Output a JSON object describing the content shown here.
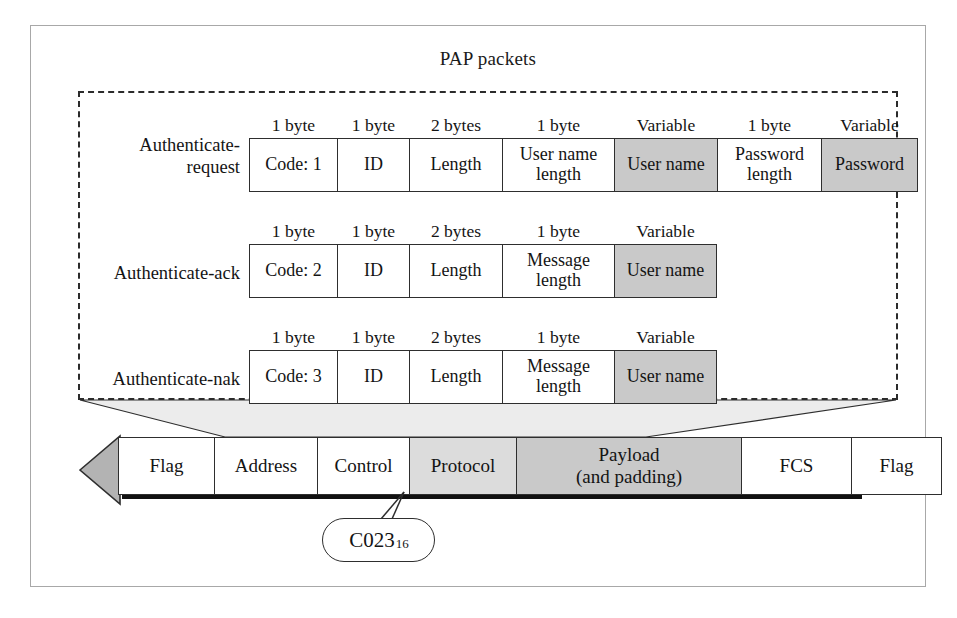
{
  "figure": {
    "pap_section_title": "PAP packets"
  },
  "packets": [
    {
      "label": "Authenticate-\nrequest",
      "fields": [
        {
          "size": "1 byte",
          "name": "Code: 1",
          "shaded": false,
          "width": 88
        },
        {
          "size": "1 byte",
          "name": "ID",
          "shaded": false,
          "width": 72
        },
        {
          "size": "2 bytes",
          "name": "Length",
          "shaded": false,
          "width": 93
        },
        {
          "size": "1 byte",
          "name": "User name\nlength",
          "shaded": false,
          "width": 112
        },
        {
          "size": "Variable",
          "name": "User name",
          "shaded": true,
          "width": 103
        },
        {
          "size": "1 byte",
          "name": "Password\nlength",
          "shaded": false,
          "width": 104
        },
        {
          "size": "Variable",
          "name": "Password",
          "shaded": true,
          "width": 97
        }
      ]
    },
    {
      "label": "Authenticate-ack",
      "fields": [
        {
          "size": "1 byte",
          "name": "Code: 2",
          "shaded": false,
          "width": 88
        },
        {
          "size": "1 byte",
          "name": "ID",
          "shaded": false,
          "width": 72
        },
        {
          "size": "2 bytes",
          "name": "Length",
          "shaded": false,
          "width": 93
        },
        {
          "size": "1 byte",
          "name": "Message\nlength",
          "shaded": false,
          "width": 112
        },
        {
          "size": "Variable",
          "name": "User name",
          "shaded": true,
          "width": 103
        }
      ]
    },
    {
      "label": "Authenticate-nak",
      "fields": [
        {
          "size": "1 byte",
          "name": "Code: 3",
          "shaded": false,
          "width": 88
        },
        {
          "size": "1 byte",
          "name": "ID",
          "shaded": false,
          "width": 72
        },
        {
          "size": "2 bytes",
          "name": "Length",
          "shaded": false,
          "width": 93
        },
        {
          "size": "1 byte",
          "name": "Message\nlength",
          "shaded": false,
          "width": 112
        },
        {
          "size": "Variable",
          "name": "User name",
          "shaded": true,
          "width": 103
        }
      ]
    }
  ],
  "ppp_frame": {
    "fields": [
      {
        "name": "Flag",
        "fill": "white",
        "width": 96
      },
      {
        "name": "Address",
        "fill": "white",
        "width": 103
      },
      {
        "name": "Control",
        "fill": "white",
        "width": 92
      },
      {
        "name": "Protocol",
        "fill": "light",
        "width": 107
      },
      {
        "name": "Payload\n(and padding)",
        "fill": "dark",
        "width": 225
      },
      {
        "name": "FCS",
        "fill": "white",
        "width": 110
      },
      {
        "name": "Flag",
        "fill": "white",
        "width": 91
      }
    ]
  },
  "callout": {
    "value": "C023",
    "subscript": "16"
  },
  "colors": {
    "shaded_cell": "#c9c9c9",
    "light_cell": "#dcdcdc",
    "arrow_fill": "#b3b3b3",
    "connector_fill": "#e6e6e6",
    "frame_border": "#a8a8a8",
    "line": "#2e2e2e"
  }
}
